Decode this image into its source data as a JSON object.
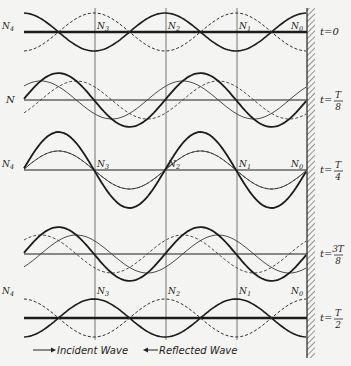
{
  "figure": {
    "geometry": {
      "x_left": 24,
      "wall_x": 307,
      "wavelength_px": 142,
      "node_xs": [
        24,
        95,
        166,
        237,
        307
      ],
      "guide_top": 8,
      "guide_bottom": 340,
      "wave_amplitude": 19,
      "wall": {
        "x": 307,
        "width": 8,
        "top": 8,
        "bottom": 358
      }
    },
    "node_labels": [
      "N4",
      "N3",
      "N2",
      "N1",
      "N0"
    ],
    "panels": [
      {
        "id": "t0",
        "time_label": "t=0",
        "time_parts": {
          "prefix": "t=",
          "num": "0",
          "den": ""
        },
        "baseline_y": 32,
        "phase": 0,
        "show_node_labels": true,
        "left_label": "N4"
      },
      {
        "id": "tT8",
        "time_label": "t=T/8",
        "time_parts": {
          "prefix": "t=",
          "num": "T",
          "den": "8"
        },
        "baseline_y": 100,
        "phase": 0.125,
        "show_node_labels": false,
        "left_label": "N"
      },
      {
        "id": "tT4",
        "time_label": "t=T/4",
        "time_parts": {
          "prefix": "t=",
          "num": "T",
          "den": "4"
        },
        "baseline_y": 170,
        "phase": 0.25,
        "show_node_labels": true,
        "left_label": "N4"
      },
      {
        "id": "t3T8",
        "time_label": "t=3T/8",
        "time_parts": {
          "prefix": "t=",
          "num": "3T",
          "den": "8"
        },
        "baseline_y": 254,
        "phase": 0.375,
        "show_node_labels": false,
        "left_label": ""
      },
      {
        "id": "tT2",
        "time_label": "t=T/2",
        "time_parts": {
          "prefix": "t=",
          "num": "T",
          "den": "2"
        },
        "baseline_y": 318,
        "phase": 0.5,
        "show_node_labels": true,
        "left_label": "N4"
      }
    ],
    "legend": {
      "incident": "Incident Wave",
      "reflected": "Reflected Wave",
      "incident_arrow": "right-arrow",
      "reflected_arrow": "left-arrow"
    },
    "colors": {
      "ink": "#1c1c1c",
      "thin": "#3a3a3a",
      "paper": "#f4f4f2"
    }
  }
}
